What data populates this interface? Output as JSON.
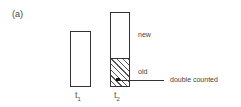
{
  "figure": {
    "panel_label": "(a)",
    "bars": [
      {
        "id": "t1",
        "label_base": "t",
        "label_sub": "1",
        "relative_height": 56
      },
      {
        "id": "t2",
        "label_base": "t",
        "label_sub": "2",
        "relative_height": 75,
        "segments": [
          {
            "name": "new",
            "label": "new",
            "pattern": "none"
          },
          {
            "name": "old",
            "label": "old",
            "pattern": "hatched"
          }
        ]
      }
    ],
    "annotation": {
      "text": "double counted",
      "points_to": "old"
    },
    "colors": {
      "stroke": "#333333",
      "background": "#ffffff",
      "text": "#444444"
    }
  }
}
